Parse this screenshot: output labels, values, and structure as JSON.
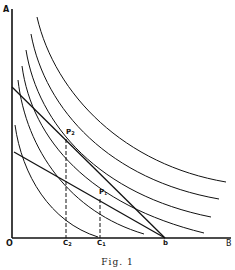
{
  "figure": {
    "caption": "Fig. 1",
    "axes": {
      "y_label": "A",
      "x_label": "B",
      "origin_label": "O"
    },
    "x_ticks": [
      {
        "label": "C",
        "sub": "2",
        "x": 66
      },
      {
        "label": "C",
        "sub": "1",
        "x": 100
      },
      {
        "label": "b",
        "sub": "",
        "x": 165
      }
    ],
    "points": [
      {
        "label": "P",
        "sub": "2",
        "x": 66,
        "y": 136
      },
      {
        "label": "P",
        "sub": "1",
        "x": 100,
        "y": 196
      }
    ],
    "budget_lines": [
      {
        "name": "steep-line",
        "from": [
          12,
          87
        ],
        "to": [
          165,
          238
        ]
      },
      {
        "name": "flat-line",
        "from": [
          14,
          152
        ],
        "to": [
          165,
          238
        ]
      }
    ],
    "indifference_curve_count": 6,
    "colors": {
      "ink": "#111111",
      "paper": "#ffffff"
    }
  }
}
